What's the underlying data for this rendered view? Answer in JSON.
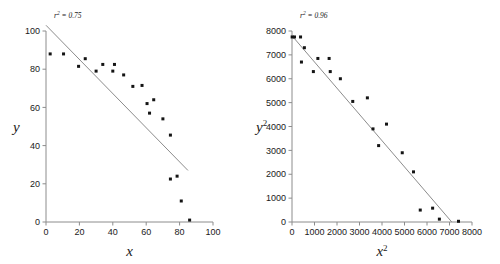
{
  "figure": {
    "background_color": "#ffffff",
    "marker_color": "#141414",
    "line_color": "#8c8c8c",
    "axis_color": "#8c8c8c"
  },
  "chart_data": [
    {
      "type": "scatter",
      "panel": "left",
      "title": "",
      "xlabel": "x",
      "ylabel": "y",
      "annotation": "r² = 0.75",
      "annotation_parts": {
        "symbol": "r",
        "sup": "2",
        "equals": " = ",
        "value": "0.75"
      },
      "r_squared": 0.75,
      "grid": false,
      "legend": "none",
      "xlim": [
        0,
        100
      ],
      "ylim": [
        0,
        100
      ],
      "xticks": [
        0,
        20,
        40,
        60,
        80,
        100
      ],
      "yticks": [
        0,
        20,
        40,
        60,
        80,
        100
      ],
      "xtick_labels": [
        "0",
        "20",
        "40",
        "60",
        "80",
        "100"
      ],
      "ytick_labels": [
        "0",
        "20",
        "40",
        "60",
        "80",
        "100"
      ],
      "points": [
        [
          2.5,
          88.0
        ],
        [
          10.5,
          88.0
        ],
        [
          19.5,
          81.5
        ],
        [
          23.5,
          85.5
        ],
        [
          30.0,
          79.0
        ],
        [
          34.0,
          82.5
        ],
        [
          40.0,
          79.0
        ],
        [
          41.0,
          82.5
        ],
        [
          46.5,
          77.0
        ],
        [
          52.0,
          71.0
        ],
        [
          57.5,
          71.5
        ],
        [
          60.5,
          62.0
        ],
        [
          62.0,
          57.0
        ],
        [
          64.5,
          64.0
        ],
        [
          70.0,
          54.0
        ],
        [
          74.5,
          45.5
        ],
        [
          74.5,
          22.5
        ],
        [
          78.5,
          24.0
        ],
        [
          81.0,
          11.0
        ],
        [
          86.0,
          1.0
        ]
      ],
      "fit_line": {
        "x": [
          0,
          85
        ],
        "y": [
          103,
          27
        ]
      }
    },
    {
      "type": "scatter",
      "panel": "right",
      "title": "",
      "xlabel": "x²",
      "ylabel": "y²",
      "xlabel_parts": {
        "base": "x",
        "sup": "2"
      },
      "ylabel_parts": {
        "base": "y",
        "sup": "2"
      },
      "annotation": "r² = 0.96",
      "annotation_parts": {
        "symbol": "r",
        "sup": "2",
        "equals": " = ",
        "value": "0.96"
      },
      "r_squared": 0.96,
      "grid": false,
      "legend": "none",
      "xlim": [
        0,
        8000
      ],
      "ylim": [
        0,
        8000
      ],
      "xticks": [
        0,
        1000,
        2000,
        3000,
        4000,
        5000,
        6000,
        7000,
        8000
      ],
      "yticks": [
        0,
        1000,
        2000,
        3000,
        4000,
        5000,
        6000,
        7000,
        8000
      ],
      "xtick_labels": [
        "0",
        "1000",
        "2000",
        "3000",
        "4000",
        "5000",
        "6000",
        "7000",
        "8000"
      ],
      "ytick_labels": [
        "0",
        "1000",
        "2000",
        "3000",
        "4000",
        "5000",
        "6000",
        "7000",
        "8000"
      ],
      "points": [
        [
          6,
          7750
        ],
        [
          110,
          7750
        ],
        [
          380,
          7750
        ],
        [
          550,
          7300
        ],
        [
          420,
          6700
        ],
        [
          950,
          6300
        ],
        [
          1150,
          6850
        ],
        [
          1650,
          6850
        ],
        [
          1700,
          6300
        ],
        [
          2150,
          6000
        ],
        [
          2700,
          5050
        ],
        [
          3350,
          5200
        ],
        [
          3600,
          3900
        ],
        [
          3850,
          3200
        ],
        [
          4200,
          4100
        ],
        [
          4900,
          2900
        ],
        [
          5400,
          2100
        ],
        [
          5700,
          500
        ],
        [
          6250,
          580
        ],
        [
          6550,
          120
        ],
        [
          7400,
          30
        ]
      ],
      "fit_line": {
        "x": [
          0,
          7100
        ],
        "y": [
          7800,
          0
        ]
      }
    }
  ]
}
